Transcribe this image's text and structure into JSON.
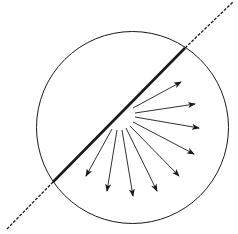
{
  "diagram": {
    "width": 238,
    "height": 234,
    "background": "#ffffff",
    "stroke_color": "#1a1a1a",
    "circle": {
      "cx": 132.5,
      "cy": 127.5,
      "r": 96,
      "stroke_width": 1
    },
    "boundary_line": {
      "dashed_start": {
        "x": 7,
        "y": 229
      },
      "solid_start": {
        "x": 53,
        "y": 182
      },
      "solid_end": {
        "x": 185,
        "y": 48
      },
      "dashed_end": {
        "x": 233,
        "y": 2
      },
      "solid_width": 2.6,
      "dashed_width": 1.3,
      "dash_pattern": "3,1.5"
    },
    "arrows": [
      {
        "x1": 133,
        "y1": 108,
        "x2": 181,
        "y2": 82
      },
      {
        "x1": 135,
        "y1": 113,
        "x2": 195,
        "y2": 104
      },
      {
        "x1": 135,
        "y1": 117,
        "x2": 199,
        "y2": 128
      },
      {
        "x1": 133,
        "y1": 122,
        "x2": 194,
        "y2": 154
      },
      {
        "x1": 130,
        "y1": 126,
        "x2": 179,
        "y2": 176
      },
      {
        "x1": 126,
        "y1": 128,
        "x2": 157,
        "y2": 191
      },
      {
        "x1": 122,
        "y1": 130,
        "x2": 133,
        "y2": 196
      },
      {
        "x1": 117,
        "y1": 130,
        "x2": 107,
        "y2": 191
      },
      {
        "x1": 112,
        "y1": 129,
        "x2": 86,
        "y2": 176
      }
    ],
    "arrow_stroke_width": 0.9
  }
}
